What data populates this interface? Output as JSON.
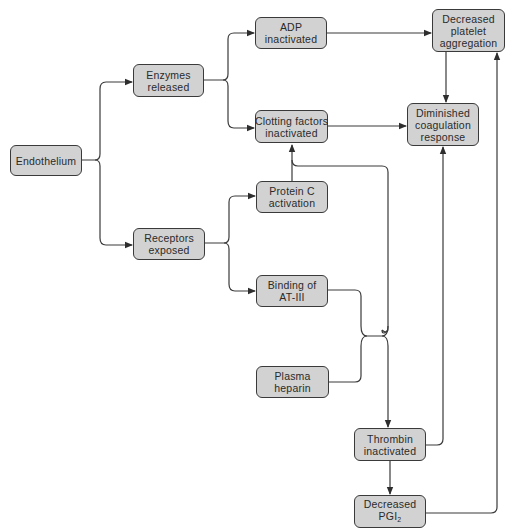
{
  "diagram": {
    "type": "flowchart",
    "colors": {
      "node_fill": "#d2d2d2",
      "node_border": "#3a3a3a",
      "edge": "#3a3a3a",
      "background": "#ffffff"
    },
    "nodes": {
      "endothelium": {
        "line1": "Endothelium"
      },
      "enzymes_released": {
        "line1": "Enzymes",
        "line2": "released"
      },
      "receptors_exposed": {
        "line1": "Receptors",
        "line2": "exposed"
      },
      "adp_inactivated": {
        "line1": "ADP",
        "line2": "inactivated"
      },
      "clotting_factors_inactivated": {
        "line1": "Clotting factors",
        "line2": "inactivated"
      },
      "protein_c_activation": {
        "line1": "Protein C",
        "line2": "activation"
      },
      "binding_at3": {
        "line1": "Binding of",
        "line2": "AT-III"
      },
      "plasma_heparin": {
        "line1": "Plasma",
        "line2": "heparin"
      },
      "decreased_platelet_aggregation": {
        "line1": "Decreased",
        "line2": "platelet",
        "line3": "aggregation"
      },
      "diminished_coagulation_response": {
        "line1": "Diminished",
        "line2": "coagulation",
        "line3": "response"
      },
      "thrombin_inactivated": {
        "line1": "Thrombin",
        "line2": "inactivated"
      },
      "decreased_pgi2": {
        "line1": "Decreased",
        "line2_base": "PGI",
        "line2_sub": "2"
      }
    },
    "edges": [
      {
        "from": "Endothelium",
        "to": "Enzymes released"
      },
      {
        "from": "Endothelium",
        "to": "Receptors exposed"
      },
      {
        "from": "Enzymes released",
        "to": "ADP inactivated"
      },
      {
        "from": "Enzymes released",
        "to": "Clotting factors inactivated"
      },
      {
        "from": "Receptors exposed",
        "to": "Protein C activation"
      },
      {
        "from": "Receptors exposed",
        "to": "Binding of AT-III"
      },
      {
        "from": "Protein C activation",
        "to": "Clotting factors inactivated"
      },
      {
        "from": "Binding of AT-III + Plasma heparin",
        "to": "Clotting factors inactivated"
      },
      {
        "from": "Binding of AT-III + Plasma heparin",
        "to": "Thrombin inactivated"
      },
      {
        "from": "ADP inactivated",
        "to": "Decreased platelet aggregation"
      },
      {
        "from": "Clotting factors inactivated",
        "to": "Diminished coagulation response"
      },
      {
        "from": "Decreased platelet aggregation",
        "to": "Diminished coagulation response"
      },
      {
        "from": "Thrombin inactivated",
        "to": "Diminished coagulation response"
      },
      {
        "from": "Thrombin inactivated",
        "to": "Decreased PGI2"
      },
      {
        "from": "Decreased PGI2",
        "to": "Decreased platelet aggregation"
      }
    ]
  }
}
